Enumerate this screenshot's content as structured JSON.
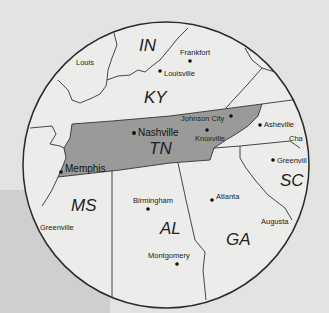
{
  "map": {
    "title": "",
    "highlighted_state": "TN",
    "colors": {
      "background": "#e3e3e1",
      "background_panel": "#cfcfcd",
      "land": "#ececea",
      "highlight": "#9a9a98",
      "border": "#333333",
      "circle": "#2a2a2a"
    },
    "states": [
      {
        "abbr": "IN",
        "label": "IN"
      },
      {
        "abbr": "KY",
        "label": "KY"
      },
      {
        "abbr": "TN",
        "label": "TN"
      },
      {
        "abbr": "MS",
        "label": "MS"
      },
      {
        "abbr": "AL",
        "label": "AL"
      },
      {
        "abbr": "GA",
        "label": "GA"
      },
      {
        "abbr": "SC",
        "label": "SC"
      }
    ],
    "cities": [
      {
        "name": "Louis",
        "dot": false
      },
      {
        "name": "Frankfort",
        "dot": true
      },
      {
        "name": "Louisville",
        "dot": true
      },
      {
        "name": "Nashville",
        "dot": true
      },
      {
        "name": "Johnson City",
        "dot": true
      },
      {
        "name": "Knoxville",
        "dot": true
      },
      {
        "name": "Asheville",
        "dot": true
      },
      {
        "name": "Cha",
        "dot": false
      },
      {
        "name": "Greenvill",
        "dot": true
      },
      {
        "name": "Memphis",
        "dot": true
      },
      {
        "name": "Birmingham",
        "dot": true
      },
      {
        "name": "Atlanta",
        "dot": true
      },
      {
        "name": "Augusta",
        "dot": false
      },
      {
        "name": "Greenville",
        "dot": false
      },
      {
        "name": "Montgomery",
        "dot": true
      }
    ]
  }
}
